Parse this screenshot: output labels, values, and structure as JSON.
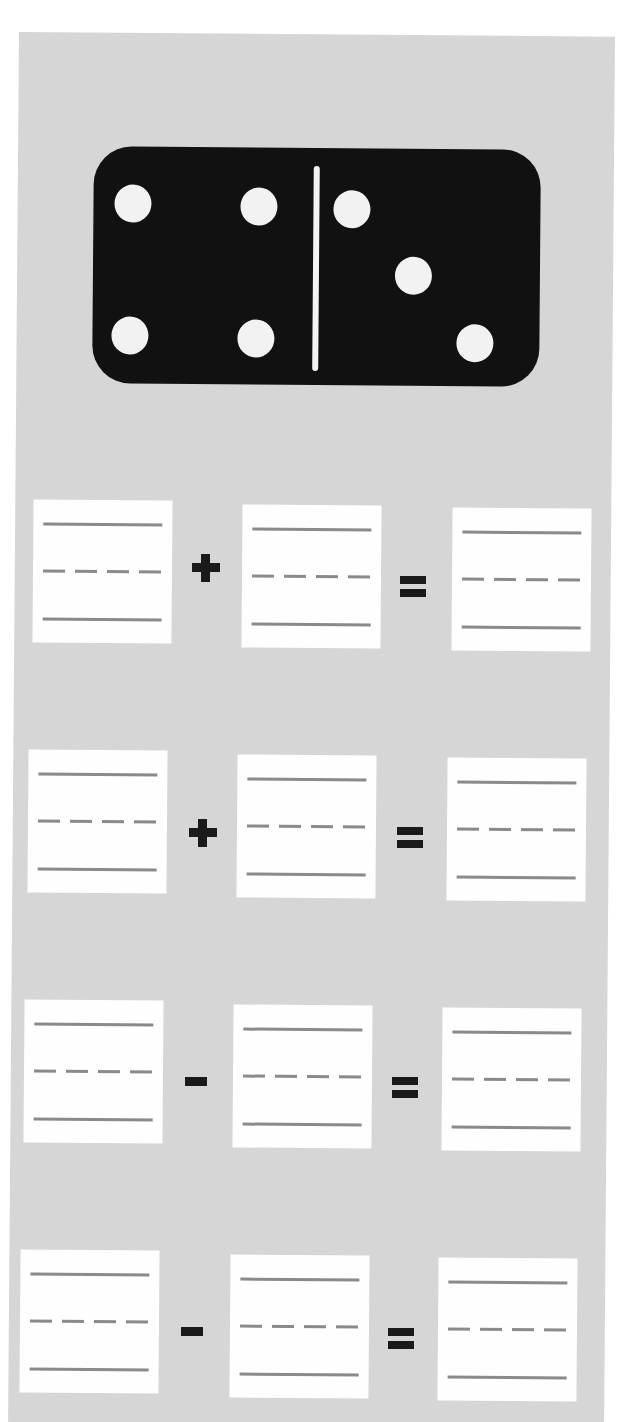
{
  "worksheet": {
    "domino": {
      "left_pips": 4,
      "right_pips": 3,
      "colors": {
        "tile": "#111111",
        "pip": "#f2f2f2",
        "divider": "#f4f4f4"
      }
    },
    "equations": [
      {
        "operator": "+",
        "operator_icon": "plus-icon",
        "equals": "=",
        "boxes": [
          "",
          "",
          ""
        ]
      },
      {
        "operator": "+",
        "operator_icon": "plus-icon",
        "equals": "=",
        "boxes": [
          "",
          "",
          ""
        ]
      },
      {
        "operator": "-",
        "operator_icon": "minus-icon",
        "equals": "=",
        "boxes": [
          "",
          "",
          ""
        ]
      },
      {
        "operator": "-",
        "operator_icon": "minus-icon",
        "equals": "=",
        "boxes": [
          "",
          "",
          ""
        ]
      }
    ],
    "colors": {
      "background": "#d6d6d6",
      "answer_box": "#fefefe",
      "guide_line": "#8a8a8a",
      "operator": "#1a1a1a"
    }
  }
}
